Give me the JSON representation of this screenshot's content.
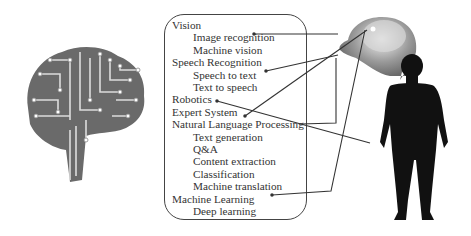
{
  "diagram": {
    "images": {
      "left": "circuit-brain",
      "top_right": "human-head-brain-xray",
      "right": "human-body-silhouette"
    },
    "categories": [
      {
        "label": "Vision",
        "children": [
          "Image recognition",
          "Machine vision"
        ],
        "connects_to": "eye"
      },
      {
        "label": "Speech Recognition",
        "children": [
          "Speech to text",
          "Text to speech"
        ],
        "connects_to": "mouth"
      },
      {
        "label": "Robotics",
        "children": [],
        "connects_to": "hand"
      },
      {
        "label": "Expert System",
        "children": [],
        "connects_to": "brain"
      },
      {
        "label": "Natural Language Processing",
        "children": [
          "Text generation",
          "Q&A",
          "Content extraction",
          "Classification",
          "Machine translation"
        ],
        "connects_to": "brain"
      },
      {
        "label": "Machine Learning",
        "children": [
          "Deep learning"
        ],
        "connects_to": "brain"
      }
    ],
    "rows": [
      {
        "text": "Vision",
        "level": 0
      },
      {
        "text": "Image recognition",
        "level": 1
      },
      {
        "text": "Machine vision",
        "level": 1
      },
      {
        "text": "Speech Recognition",
        "level": 0
      },
      {
        "text": "Speech to text",
        "level": 1
      },
      {
        "text": "Text to speech",
        "level": 1
      },
      {
        "text": "Robotics",
        "level": 0
      },
      {
        "text": "Expert System",
        "level": 0
      },
      {
        "text": "Natural Language Processing",
        "level": 0
      },
      {
        "text": "Text generation",
        "level": 1
      },
      {
        "text": "Q&A",
        "level": 1
      },
      {
        "text": "Content extraction",
        "level": 1
      },
      {
        "text": "Classification",
        "level": 1
      },
      {
        "text": "Machine translation",
        "level": 1
      },
      {
        "text": "Machine Learning",
        "level": 0
      },
      {
        "text": "Deep learning",
        "level": 1
      }
    ],
    "colors": {
      "line": "#333333",
      "silhouette": "#111111",
      "box_border": "#444444"
    }
  }
}
